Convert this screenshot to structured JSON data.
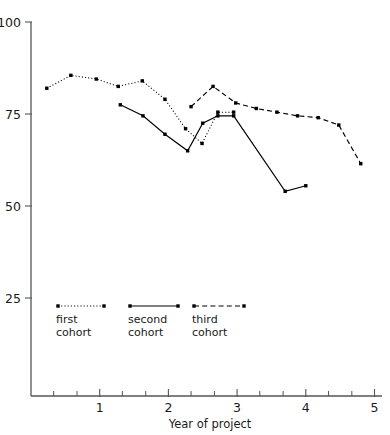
{
  "chart_data": {
    "type": "line",
    "title": "",
    "xlabel": "Year of project",
    "ylabel": "",
    "xlim": [
      0.0,
      5.1
    ],
    "ylim": [
      18,
      102
    ],
    "grid": false,
    "legend_position": "inside-bottom-left",
    "x_ticks_major": [
      1,
      2,
      3,
      4,
      5
    ],
    "x_tick_labels": [
      "1",
      "2",
      "3",
      "4",
      "5"
    ],
    "x_ticks_minor": [
      0.33,
      0.67,
      1.33,
      1.67,
      2.33,
      2.67,
      3.33,
      3.67,
      4.33,
      4.67
    ],
    "y_ticks": [
      25,
      50,
      75,
      100
    ],
    "y_tick_labels": [
      "25",
      "50",
      "75",
      "100"
    ],
    "series": [
      {
        "name": "first cohort",
        "style": "dotted",
        "x": [
          0.23,
          0.58,
          0.95,
          1.27,
          1.62,
          1.95,
          2.25,
          2.49,
          2.72,
          2.95
        ],
        "values": [
          82,
          85.5,
          84.5,
          82.5,
          84,
          79,
          71,
          67,
          75.5,
          75.5
        ]
      },
      {
        "name": "second cohort",
        "style": "solid",
        "x": [
          1.3,
          1.63,
          1.95,
          2.28,
          2.5,
          2.72,
          2.95,
          3.7,
          4.0
        ],
        "values": [
          77.5,
          74.5,
          69.5,
          65,
          72.5,
          74.5,
          74.5,
          54,
          55.5
        ]
      },
      {
        "name": "third cohort",
        "style": "dashed",
        "x": [
          2.33,
          2.65,
          2.98,
          3.28,
          3.58,
          3.88,
          4.18,
          4.48,
          4.8
        ],
        "values": [
          77,
          82.5,
          78,
          76.5,
          75.5,
          74.5,
          74,
          72,
          61.5
        ]
      }
    ]
  },
  "legend": {
    "entries": [
      {
        "label_line1": "first",
        "label_line2": "cohort",
        "style": "dotted"
      },
      {
        "label_line1": "second",
        "label_line2": "cohort",
        "style": "solid"
      },
      {
        "label_line1": "third",
        "label_line2": "cohort",
        "style": "dashed"
      }
    ]
  },
  "colors": {
    "ink": "#000000",
    "axis": "#555555",
    "background": "#ffffff"
  }
}
